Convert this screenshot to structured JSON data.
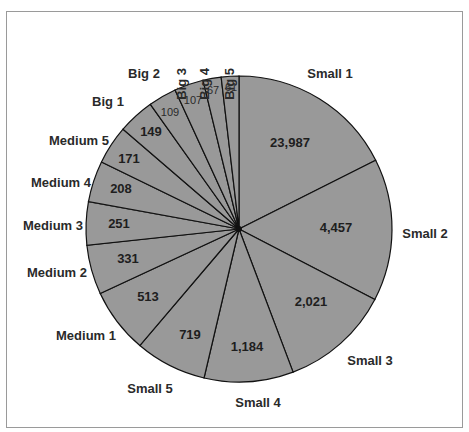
{
  "chart_data": {
    "type": "pie",
    "title": "",
    "categories": [
      "Small 1",
      "Small 2",
      "Small 3",
      "Small 4",
      "Small 5",
      "Medium 1",
      "Medium 2",
      "Medium 3",
      "Medium 4",
      "Medium 5",
      "Big 1",
      "Big 2",
      "Big 3",
      "Big 4",
      "Big 5"
    ],
    "values": [
      23987,
      4457,
      2021,
      1184,
      719,
      513,
      331,
      251,
      208,
      171,
      149,
      109,
      107,
      67,
      61
    ],
    "value_labels": [
      "23,987",
      "4,457",
      "2,021",
      "1,184",
      "719",
      "513",
      "331",
      "251",
      "208",
      "171",
      "149",
      "109",
      "107",
      "67",
      "61"
    ],
    "slice_boundaries_deg_clockwise_from_top": [
      0,
      63.3,
      117.4,
      159.3,
      193.2,
      220.4,
      245.1,
      263.9,
      280.3,
      296.0,
      310.7,
      324.6,
      335.3,
      346.4,
      353.3,
      360
    ],
    "fill_color": "#999999",
    "edge_color": "#111111",
    "legend": "none",
    "labels_outside": true,
    "values_inside": true
  }
}
